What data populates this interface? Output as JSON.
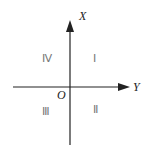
{
  "diagram": {
    "type": "coordinate-quadrants",
    "axes": {
      "vertical_label": "X",
      "horizontal_label": "Y",
      "origin_label": "O"
    },
    "quadrants": [
      {
        "id": "upper-right",
        "label": "Ⅰ"
      },
      {
        "id": "lower-right",
        "label": "Ⅱ"
      },
      {
        "id": "lower-left",
        "label": "Ⅲ"
      },
      {
        "id": "upper-left",
        "label": "Ⅳ"
      }
    ],
    "colors": {
      "axis": "#222222",
      "quadrant_text": "#777777",
      "background": "#ffffff"
    }
  }
}
